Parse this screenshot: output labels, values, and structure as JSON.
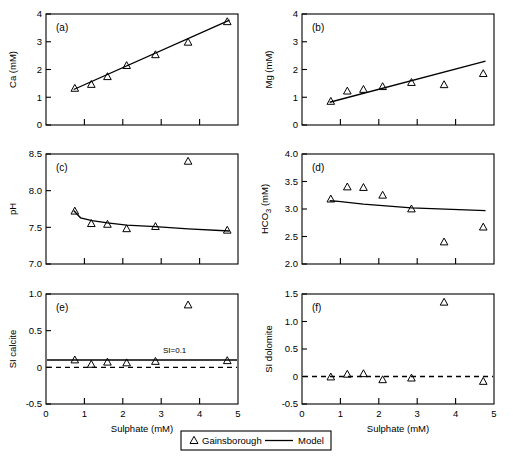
{
  "figure": {
    "xlabel": "Sulphate (mM)",
    "legend": {
      "series_marker_label": "Gainsborough",
      "series_line_label": "Model"
    }
  },
  "chart_data": [
    {
      "type": "scatter",
      "panel": "(a)",
      "title": "",
      "xlabel": "Sulphate (mM)",
      "ylabel": "Ca (mM)",
      "xlim": [
        0,
        5
      ],
      "ylim": [
        0,
        4
      ],
      "xticks": [
        0,
        1,
        2,
        3,
        4,
        5
      ],
      "xticklabels": [
        "",
        "",
        "",
        "",
        "",
        ""
      ],
      "yticks": [
        0,
        1,
        2,
        3,
        4
      ],
      "yticklabels": [
        "0",
        "1",
        "2",
        "3",
        "4"
      ],
      "grid": false,
      "series": [
        {
          "name": "Gainsborough",
          "kind": "scatter",
          "marker": "triangle-up-open",
          "x": [
            0.75,
            1.18,
            1.6,
            2.1,
            2.85,
            3.7,
            4.72
          ],
          "y": [
            1.32,
            1.46,
            1.74,
            2.14,
            2.53,
            2.98,
            3.72
          ]
        },
        {
          "name": "Model",
          "kind": "line",
          "x": [
            0.72,
            4.78
          ],
          "y": [
            1.28,
            3.78
          ]
        }
      ]
    },
    {
      "type": "scatter",
      "panel": "(b)",
      "title": "",
      "xlabel": "Sulphate (mM)",
      "ylabel": "Mg (mM)",
      "xlim": [
        0,
        5
      ],
      "ylim": [
        0,
        4
      ],
      "xticks": [
        0,
        1,
        2,
        3,
        4,
        5
      ],
      "xticklabels": [
        "",
        "",
        "",
        "",
        "",
        ""
      ],
      "yticks": [
        0,
        1,
        2,
        3,
        4
      ],
      "yticklabels": [
        "0",
        "1",
        "2",
        "3",
        "4"
      ],
      "grid": false,
      "series": [
        {
          "name": "Gainsborough",
          "kind": "scatter",
          "marker": "triangle-up-open",
          "x": [
            0.75,
            1.18,
            1.6,
            2.1,
            2.85,
            3.7,
            4.72
          ],
          "y": [
            0.85,
            1.22,
            1.28,
            1.38,
            1.53,
            1.45,
            1.85
          ]
        },
        {
          "name": "Model",
          "kind": "line",
          "x": [
            0.72,
            4.78
          ],
          "y": [
            0.82,
            2.3
          ]
        }
      ]
    },
    {
      "type": "scatter",
      "panel": "(c)",
      "title": "",
      "xlabel": "Sulphate (mM)",
      "ylabel": "pH",
      "xlim": [
        0,
        5
      ],
      "ylim": [
        7.0,
        8.5
      ],
      "xticks": [
        0,
        1,
        2,
        3,
        4,
        5
      ],
      "xticklabels": [
        "",
        "",
        "",
        "",
        "",
        ""
      ],
      "yticks": [
        7.0,
        7.5,
        8.0,
        8.5
      ],
      "yticklabels": [
        "7.0",
        "7.5",
        "8.0",
        "8.5"
      ],
      "grid": false,
      "series": [
        {
          "name": "Gainsborough",
          "kind": "scatter",
          "marker": "triangle-up-open",
          "x": [
            0.75,
            1.18,
            1.6,
            2.1,
            2.85,
            3.7,
            4.72
          ],
          "y": [
            7.72,
            7.55,
            7.54,
            7.48,
            7.51,
            8.4,
            7.46
          ]
        },
        {
          "name": "Model",
          "kind": "line",
          "x": [
            0.72,
            0.9,
            1.2,
            1.6,
            2.1,
            2.85,
            3.7,
            4.78
          ],
          "y": [
            7.73,
            7.63,
            7.59,
            7.56,
            7.53,
            7.51,
            7.48,
            7.45
          ]
        }
      ]
    },
    {
      "type": "scatter",
      "panel": "(d)",
      "title": "",
      "xlabel": "Sulphate (mM)",
      "ylabel": "HCO3 (mM)",
      "ylabel_parts": [
        "HCO",
        "3",
        " (mM)"
      ],
      "xlim": [
        0,
        5
      ],
      "ylim": [
        2.0,
        4.0
      ],
      "xticks": [
        0,
        1,
        2,
        3,
        4,
        5
      ],
      "xticklabels": [
        "",
        "",
        "",
        "",
        "",
        ""
      ],
      "yticks": [
        2.0,
        2.5,
        3.0,
        3.5,
        4.0
      ],
      "yticklabels": [
        "2.0",
        "2.5",
        "3.0",
        "3.5",
        "4.0"
      ],
      "grid": false,
      "series": [
        {
          "name": "Gainsborough",
          "kind": "scatter",
          "marker": "triangle-up-open",
          "x": [
            0.75,
            1.18,
            1.6,
            2.1,
            2.85,
            3.7,
            4.72
          ],
          "y": [
            3.18,
            3.4,
            3.39,
            3.25,
            3.0,
            2.4,
            2.67
          ]
        },
        {
          "name": "Model",
          "kind": "line",
          "x": [
            0.72,
            0.95,
            1.6,
            2.85,
            4.78
          ],
          "y": [
            3.15,
            3.14,
            3.09,
            3.02,
            2.97
          ]
        }
      ]
    },
    {
      "type": "scatter",
      "panel": "(e)",
      "title": "",
      "xlabel": "Sulphate (mM)",
      "ylabel": "SI calcite",
      "xlim": [
        0,
        5
      ],
      "ylim": [
        -0.5,
        1.0
      ],
      "xticks": [
        0,
        1,
        2,
        3,
        4,
        5
      ],
      "xticklabels": [
        "0",
        "1",
        "2",
        "3",
        "4",
        "5"
      ],
      "yticks": [
        -0.5,
        0,
        0.5,
        1.0
      ],
      "yticklabels": [
        "-0.5",
        "0",
        "0.5",
        "1.0"
      ],
      "grid": false,
      "annotations": [
        {
          "text": "SI=0.1",
          "x": 3.35,
          "y": 0.2
        }
      ],
      "reference_lines": [
        {
          "kind": "solid",
          "y": 0.1,
          "label": "SI=0.1"
        },
        {
          "kind": "dashed",
          "y": 0.0,
          "label": ""
        }
      ],
      "series": [
        {
          "name": "Gainsborough",
          "kind": "scatter",
          "marker": "triangle-up-open",
          "x": [
            0.75,
            1.18,
            1.6,
            2.1,
            2.85,
            3.7,
            4.72
          ],
          "y": [
            0.1,
            0.04,
            0.07,
            0.06,
            0.08,
            0.85,
            0.09
          ]
        }
      ]
    },
    {
      "type": "scatter",
      "panel": "(f)",
      "title": "",
      "xlabel": "Sulphate (mM)",
      "ylabel": "SI dolomite",
      "xlim": [
        0,
        5
      ],
      "ylim": [
        -0.5,
        1.5
      ],
      "xticks": [
        0,
        1,
        2,
        3,
        4,
        5
      ],
      "xticklabels": [
        "0",
        "1",
        "2",
        "3",
        "4",
        "5"
      ],
      "yticks": [
        -0.5,
        0,
        0.5,
        1.0,
        1.5
      ],
      "yticklabels": [
        "-0.5",
        "0",
        "0.5",
        "1.0",
        "1.5"
      ],
      "grid": false,
      "reference_lines": [
        {
          "kind": "dashed",
          "y": 0.0,
          "label": ""
        }
      ],
      "series": [
        {
          "name": "Gainsborough",
          "kind": "scatter",
          "marker": "triangle-up-open",
          "x": [
            0.75,
            1.18,
            1.6,
            2.1,
            2.85,
            3.7,
            4.72
          ],
          "y": [
            -0.01,
            0.04,
            0.05,
            -0.06,
            -0.03,
            1.35,
            -0.09
          ]
        }
      ]
    }
  ]
}
